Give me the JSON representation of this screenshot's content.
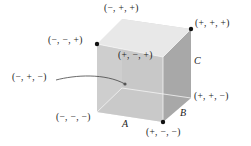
{
  "diagram": {
    "type": "cube-vertex-sign-diagram",
    "vertices": {
      "top_back_left": "(−, +, +)",
      "top_front_left": "(−, −, +)",
      "top_back_right": "(+, +, +)",
      "top_front_right": "(+, −, +)",
      "bottom_back_left": "(−, +, −)",
      "bottom_front_left": "(−, −, −)",
      "bottom_back_right": "(+, +, −)",
      "bottom_front_right": "(+, −, −)"
    },
    "edge_labels": {
      "A": "A",
      "B": "B",
      "C": "C"
    },
    "colors": {
      "top_face": "#e6e6e6",
      "front_face": "#c4c4c4",
      "right_face": "#a9a9a9",
      "bottom_inner": "#d9d9d9",
      "edge": "#ffffff",
      "dot": "#111111",
      "leader_line": "#444444"
    }
  }
}
